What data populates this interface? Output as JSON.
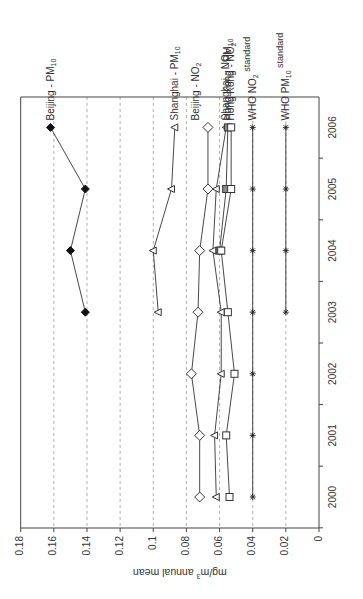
{
  "chart_data": {
    "type": "line",
    "orientation": "rotated-90-ccw",
    "title": "",
    "xlabel": "",
    "ylabel": "mg/m3 annual mean",
    "ylabel_display": {
      "prefix": "mg/m",
      "sup": "3",
      "suffix": " annual mean"
    },
    "x": [
      2000,
      2001,
      2002,
      2003,
      2004,
      2005,
      2006
    ],
    "x_tick_labels": [
      "2000",
      "2001",
      "2002",
      "2003",
      "2004",
      "2005",
      "2006"
    ],
    "ylim": [
      0,
      0.18
    ],
    "y_ticks": [
      0,
      0.02,
      0.04,
      0.06,
      0.08,
      0.1,
      0.12,
      0.14,
      0.16,
      0.18
    ],
    "y_tick_labels": [
      "0",
      "0.02",
      "0.04",
      "0.06",
      "0.08",
      "0.1",
      "0.12",
      "0.14",
      "0.16",
      "0.18"
    ],
    "grid": {
      "value_axis": true,
      "style": "dashed"
    },
    "legend": "inline labels at 2006 end of each series",
    "series": [
      {
        "name": "Beijing - PM10",
        "label_main": "Beijing - PM",
        "label_sub": "10",
        "label_after": "",
        "marker": "filled-diamond",
        "values": [
          null,
          null,
          null,
          0.141,
          0.15,
          0.141,
          0.162
        ]
      },
      {
        "name": "Shanghai - PM10",
        "label_main": "Shanghai - PM",
        "label_sub": "10",
        "label_after": "",
        "marker": "open-triangle",
        "values": [
          null,
          null,
          null,
          0.097,
          0.1,
          0.089,
          0.087
        ]
      },
      {
        "name": "Beijing - NO2",
        "label_main": "Beijing - NO",
        "label_sub": "2",
        "label_after": "",
        "marker": "open-diamond",
        "values": [
          0.072,
          0.072,
          0.077,
          0.073,
          0.072,
          0.067,
          0.067
        ]
      },
      {
        "name": "Shanghai - NO2",
        "label_main": "Shanghai - NO",
        "label_sub": "2",
        "label_after": "",
        "marker": "open-triangle",
        "values": [
          0.062,
          0.063,
          0.059,
          0.059,
          0.064,
          0.062,
          0.056
        ]
      },
      {
        "name": "Hong Kong - PM10",
        "label_main": "Hong Kong - PM",
        "label_sub": "10",
        "label_after": "",
        "marker": "filled-gray-square",
        "values": [
          null,
          null,
          null,
          null,
          0.06,
          0.056,
          0.055
        ]
      },
      {
        "name": "Hong Kong - NO2",
        "label_main": "Hong Kong - NO",
        "label_sub": "2",
        "label_after": "",
        "marker": "open-square",
        "values": [
          0.054,
          0.056,
          0.051,
          0.055,
          0.059,
          0.053,
          0.053
        ]
      },
      {
        "name": "WHO NO2 standard",
        "label_main": "WHO NO",
        "label_sub": "2",
        "label_after": " standard",
        "marker": "asterisk",
        "values": [
          0.04,
          0.04,
          0.04,
          0.04,
          0.04,
          0.04,
          0.04
        ]
      },
      {
        "name": "WHO PM10 standard",
        "label_main": "WHO PM",
        "label_sub": "10",
        "label_after": " standard",
        "marker": "asterisk",
        "values": [
          null,
          null,
          null,
          0.02,
          0.02,
          0.02,
          0.02
        ]
      }
    ]
  }
}
